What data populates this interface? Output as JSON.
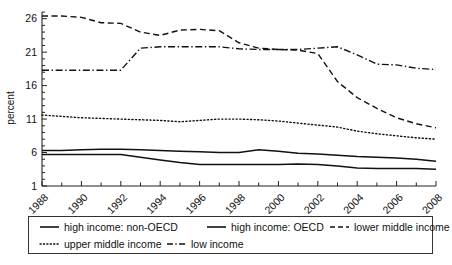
{
  "chart_data": {
    "type": "line",
    "title": "",
    "xlabel": "",
    "ylabel": "percent",
    "x": [
      1988,
      1989,
      1990,
      1991,
      1992,
      1993,
      1994,
      1995,
      1996,
      1997,
      1998,
      1999,
      2000,
      2001,
      2002,
      2003,
      2004,
      2005,
      2006,
      2007,
      2008
    ],
    "xlim": [
      1988,
      2008
    ],
    "ylim": [
      1,
      27
    ],
    "yticks": [
      1,
      6,
      11,
      16,
      21,
      26
    ],
    "xticks": [
      1988,
      1990,
      1992,
      1994,
      1996,
      1998,
      2000,
      2002,
      2004,
      2006,
      2008
    ],
    "xticks_minor": [
      1989,
      1991,
      1993,
      1995,
      1997,
      1999,
      2001,
      2003,
      2005,
      2007
    ],
    "grid": false,
    "legend_position": "bottom",
    "legend_rows": [
      [
        "high income: non-OECD",
        "high income: OECD",
        "lower middle income"
      ],
      [
        "upper middle income",
        "low income"
      ]
    ],
    "series": [
      {
        "name": "high income: non-OECD",
        "style": "solid",
        "values": [
          6.3,
          6.3,
          6.4,
          6.5,
          6.5,
          6.4,
          6.3,
          6.2,
          6.1,
          6.0,
          6.0,
          6.4,
          6.2,
          5.9,
          5.8,
          5.6,
          5.4,
          5.3,
          5.2,
          5.0,
          4.7
        ]
      },
      {
        "name": "high income: OECD",
        "style": "solid",
        "values": [
          5.7,
          5.7,
          5.7,
          5.7,
          5.7,
          5.3,
          4.9,
          4.5,
          4.2,
          4.2,
          4.2,
          4.2,
          4.2,
          4.3,
          4.2,
          4.0,
          3.7,
          3.6,
          3.6,
          3.6,
          3.5
        ]
      },
      {
        "name": "lower middle income",
        "style": "dashed",
        "values": [
          26.4,
          26.4,
          26.2,
          25.4,
          25.3,
          24.0,
          23.5,
          24.3,
          24.4,
          24.2,
          22.4,
          21.6,
          21.4,
          21.3,
          20.8,
          16.6,
          14.2,
          12.6,
          11.2,
          10.3,
          9.7
        ]
      },
      {
        "name": "upper middle income",
        "style": "dotted",
        "values": [
          11.6,
          11.4,
          11.2,
          11.1,
          11.0,
          10.9,
          10.8,
          10.6,
          10.8,
          11.0,
          11.0,
          10.9,
          10.7,
          10.4,
          10.1,
          9.8,
          9.2,
          8.8,
          8.5,
          8.2,
          8.0
        ]
      },
      {
        "name": "low income",
        "style": "dash-dot",
        "values": [
          18.3,
          18.3,
          18.3,
          18.3,
          18.3,
          21.6,
          21.8,
          21.8,
          21.8,
          21.8,
          21.5,
          21.4,
          21.4,
          21.4,
          21.6,
          21.8,
          20.6,
          19.2,
          19.1,
          18.6,
          18.4
        ]
      }
    ]
  },
  "axis": {
    "y_title": "percent",
    "y_tick_labels": [
      "1",
      "6",
      "11",
      "16",
      "21",
      "26"
    ],
    "x_tick_labels": [
      "1988",
      "1990",
      "1992",
      "1994",
      "1996",
      "1998",
      "2000",
      "2002",
      "2004",
      "2006",
      "2008"
    ]
  },
  "legend": {
    "items": [
      {
        "label": "high income: non-OECD",
        "style": "solid"
      },
      {
        "label": "high income: OECD",
        "style": "solid"
      },
      {
        "label": "lower middle income",
        "style": "dashed"
      },
      {
        "label": "upper middle income",
        "style": "dotted"
      },
      {
        "label": "low income",
        "style": "dash-dot"
      }
    ]
  }
}
